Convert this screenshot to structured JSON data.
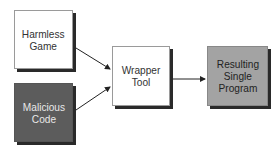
{
  "diagram": {
    "nodes": [
      {
        "id": "harmless-game",
        "label": "Harmless\nGame",
        "fill": "#ffffff"
      },
      {
        "id": "malicious-code",
        "label": "Malicious\nCode",
        "fill": "#5c5c5c"
      },
      {
        "id": "wrapper-tool",
        "label": "Wrapper\nTool",
        "fill": "#ffffff"
      },
      {
        "id": "resulting-program",
        "label": "Resulting\nSingle\nProgram",
        "fill": "#a3a3a3"
      }
    ],
    "edges": [
      {
        "from": "harmless-game",
        "to": "wrapper-tool"
      },
      {
        "from": "malicious-code",
        "to": "wrapper-tool"
      },
      {
        "from": "wrapper-tool",
        "to": "resulting-program"
      }
    ]
  }
}
